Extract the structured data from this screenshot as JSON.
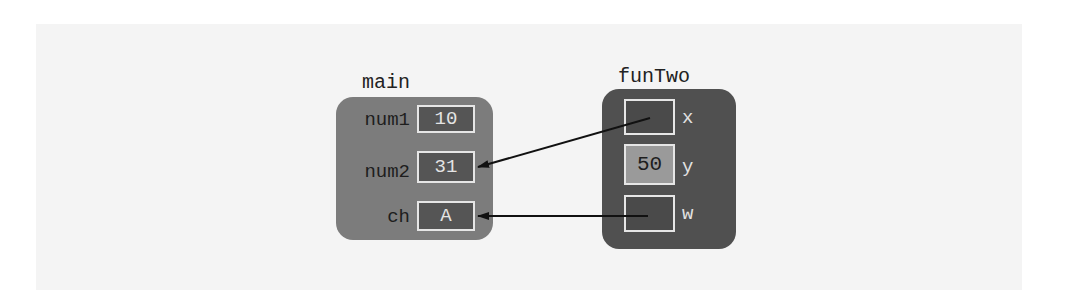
{
  "diagram": {
    "type": "memory-stack-frames",
    "frames": [
      {
        "name": "main",
        "variables": [
          {
            "name": "num1",
            "value": "10"
          },
          {
            "name": "num2",
            "value": "31"
          },
          {
            "name": "ch",
            "value": "A"
          }
        ]
      },
      {
        "name": "funTwo",
        "variables": [
          {
            "name": "x",
            "value": "",
            "points_to": "num2"
          },
          {
            "name": "y",
            "value": "50"
          },
          {
            "name": "w",
            "value": "",
            "points_to": "ch"
          }
        ]
      }
    ],
    "arrows": [
      {
        "from": "funTwo.x",
        "to": "main.num2"
      },
      {
        "from": "funTwo.w",
        "to": "main.ch"
      }
    ],
    "colors": {
      "background_panel": "#f4f4f4",
      "main_frame": "#7c7c7c",
      "funTwo_frame": "#505050",
      "cell_dark": "#555555",
      "cell_light": "#9a9a9a",
      "cell_border": "#e6e6e6",
      "arrow": "#111111"
    }
  }
}
